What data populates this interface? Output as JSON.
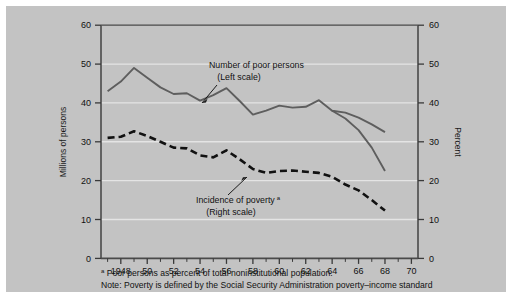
{
  "figure": {
    "background_color": "#c3c3c3",
    "page_background": "#ffffff",
    "frame_color": "#4a4a4a"
  },
  "annotations": {
    "series1_line1": "Number of poor persons",
    "series1_line2": "(Left scale)",
    "series2_line1": "Incidence of poverty",
    "series2_marker": "a",
    "series2_line2": "(Right scale)"
  },
  "footnotes": {
    "marker": "a",
    "line1": " Poor persons as percent of total noninstitutional population.",
    "line2": "Note: Poverty is defined by the Social Security Administration poverty–income standard"
  },
  "chart_data": {
    "type": "line",
    "title": "",
    "xlabel": "",
    "ylabel": "Millions of persons",
    "y2label": "Percent",
    "xlim": [
      1946.5,
      1970.5
    ],
    "ylim": [
      0,
      60
    ],
    "y2lim": [
      0,
      60
    ],
    "yticks": [
      0,
      10,
      20,
      30,
      40,
      50,
      60
    ],
    "y2ticks": [
      0,
      10,
      20,
      30,
      40,
      50,
      60
    ],
    "ytick_labels": [
      "0",
      "10",
      "20",
      "30",
      "40",
      "50",
      "60"
    ],
    "y2tick_labels": [
      "0",
      "10",
      "20",
      "30",
      "40",
      "50",
      "60"
    ],
    "xticks_major": [
      1948,
      1950,
      1952,
      1954,
      1956,
      1958,
      1960,
      1962,
      1964,
      1966,
      1968,
      1970
    ],
    "xtick_labels": [
      "1948",
      "50",
      "52",
      "54",
      "56",
      "58",
      "60",
      "62",
      "64",
      "66",
      "68",
      "70"
    ],
    "xticks_minor": [
      1947,
      1949,
      1951,
      1953,
      1955,
      1957,
      1959,
      1961,
      1963,
      1965,
      1967,
      1969
    ],
    "grid": "horizontal",
    "grid_color": "#e8e8e8",
    "legend_position": "inline-annotations",
    "series": [
      {
        "name": "Number of poor persons",
        "scale": "left",
        "units": "millions of persons",
        "style": "solid",
        "color": "#5e5e5e",
        "x": [
          1947,
          1948,
          1949,
          1950,
          1951,
          1952,
          1953,
          1954,
          1955,
          1956,
          1957,
          1958,
          1959,
          1960,
          1961,
          1962,
          1963,
          1964,
          1965,
          1966,
          1967,
          1968
        ],
        "values": [
          43.0,
          45.5,
          49.0,
          46.5,
          44.0,
          42.3,
          42.5,
          40.6,
          42.0,
          43.8,
          40.5,
          37.0,
          38.0,
          39.3,
          38.8,
          39.0,
          40.7,
          38.0,
          37.5,
          36.2,
          34.5,
          32.5
        ]
      },
      {
        "name": "Number of poor persons (tail)",
        "scale": "left",
        "units": "millions of persons",
        "style": "solid",
        "color": "#5e5e5e",
        "x": [
          1964,
          1965,
          1966,
          1967,
          1968
        ],
        "values": [
          38.0,
          36.0,
          33.0,
          28.5,
          22.5
        ]
      },
      {
        "name": "Incidence of poverty",
        "scale": "right",
        "units": "percent",
        "style": "dashed",
        "color": "#111111",
        "x": [
          1947,
          1948,
          1949,
          1950,
          1951,
          1952,
          1953,
          1954,
          1955,
          1956,
          1957,
          1958,
          1959,
          1960,
          1961,
          1962,
          1963,
          1964,
          1965,
          1966,
          1967,
          1968
        ],
        "values": [
          31.0,
          31.3,
          32.7,
          31.5,
          30.0,
          28.5,
          28.3,
          26.5,
          26.0,
          27.8,
          25.5,
          23.0,
          22.0,
          22.5,
          22.6,
          22.3,
          22.0,
          21.0,
          19.0,
          17.5,
          15.0,
          12.3
        ]
      }
    ]
  }
}
